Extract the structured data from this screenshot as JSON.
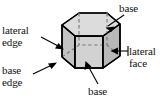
{
  "figure": {
    "name": "hexagonal-prism-labeled-diagram",
    "width": 166,
    "height": 105,
    "background_color": "#ffffff"
  },
  "colors": {
    "outline": "#000000",
    "top_face_fill": "#d9d9d9",
    "front_left_face_fill": "#c9c9c9",
    "front_center_face_fill": "#d2d2d2",
    "front_right_face_fill": "#bcbcbc",
    "hidden_edge": "#8a8a8a",
    "text": "#111111",
    "leader_line": "#000000"
  },
  "labels": {
    "lateral_edge": {
      "line1": "lateral",
      "line2": "edge"
    },
    "base_top": {
      "line1": "base"
    },
    "lateral_face": {
      "line1": "lateral",
      "line2": "face"
    },
    "base_edge": {
      "line1": "base",
      "line2": "edge"
    },
    "base_bottom": {
      "line1": "base"
    }
  },
  "shape": {
    "type": "hexagonal prism",
    "top_face_vertices": [
      [
        62,
        25
      ],
      [
        79,
        13
      ],
      [
        107,
        13
      ],
      [
        120,
        24
      ],
      [
        103,
        36
      ],
      [
        75,
        36
      ]
    ],
    "bottom_face_vertices": [
      [
        62,
        57
      ],
      [
        79,
        45
      ],
      [
        107,
        45
      ],
      [
        120,
        56
      ],
      [
        103,
        68
      ],
      [
        75,
        68
      ]
    ],
    "visible_vertical_edges": [
      [
        62,
        25
      ],
      [
        75,
        36
      ],
      [
        103,
        36
      ],
      [
        120,
        24
      ]
    ],
    "hidden_vertical_edge": [
      79,
      13
    ],
    "hidden_edges_style": "dashed"
  },
  "leaders": [
    {
      "name": "lateral-edge-leader",
      "from": [
        41,
        37
      ],
      "to": [
        63,
        48
      ],
      "arrow_at": "to"
    },
    {
      "name": "base-top-leader",
      "from": [
        122,
        16
      ],
      "to": [
        106,
        27
      ],
      "arrow_at": "to"
    },
    {
      "name": "lateral-face-leader",
      "from": [
        128,
        51
      ],
      "to": [
        112,
        51
      ],
      "arrow_at": "to"
    },
    {
      "name": "base-edge-leader",
      "from": [
        33,
        73
      ],
      "to": [
        55,
        63
      ],
      "arrow_at": "to"
    },
    {
      "name": "base-bottom-leader",
      "from": [
        97,
        85
      ],
      "to": [
        86,
        63
      ],
      "arrow_at": "to"
    }
  ]
}
